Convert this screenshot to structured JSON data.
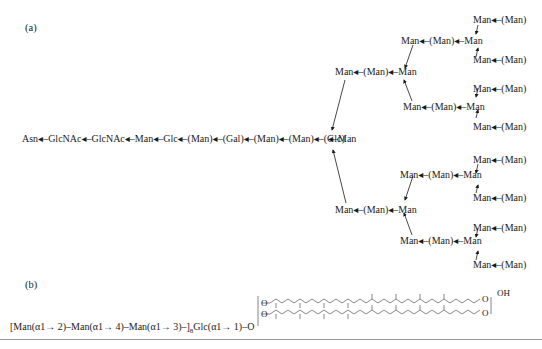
{
  "panel_a": {
    "label": "(a)",
    "main_chain": "Asn◂–GlcNAc◂–GlcNAc◂–Man◂–Glc◂–(Man)◂–(Gal)◂–(Man)◂–(Man)◂–(Glc)",
    "glc_right": "◂–Man",
    "upper_branch": "Man◂–(Man)◂–Man",
    "lower_branch": "Man◂–(Man)◂–Man",
    "upper_upper": "Man◂–(Man)◂–Man",
    "upper_lower": "Man◂–(Man)◂–Man",
    "lower_upper": "Man◂–(Man)◂–Man",
    "lower_lower": "Man◂–(Man)◂–Man",
    "terminal": "Man◂–(Man)"
  },
  "panel_b": {
    "label": "(b)",
    "formula_prefix": "[Man(α1→ 2)–Man(α1→ 4)–Man(α1→ 3)–]",
    "subscript": "8",
    "formula_suffix": "Glc(α1→ 1)–O",
    "lipid_o": "O",
    "oh": "OH"
  }
}
